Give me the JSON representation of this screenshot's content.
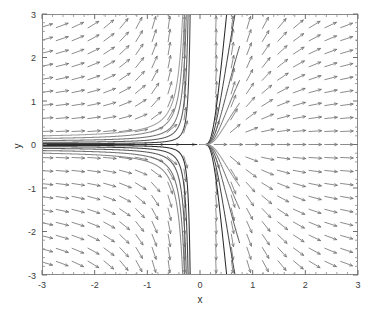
{
  "figure": {
    "background_color": "#ffffff",
    "plot_box": {
      "left": 42,
      "top": 14,
      "right": 358,
      "bottom": 275
    },
    "axis_color": "#808080",
    "tick_label_color": "#3a3a3a"
  },
  "chart_data": {
    "type": "scatter",
    "title": "",
    "subtitle": "",
    "xlabel": "x",
    "ylabel": "y",
    "xlim": [
      -3,
      3
    ],
    "ylim": [
      -3,
      3
    ],
    "xticks": [
      -3,
      -2,
      -1,
      0,
      1,
      2,
      3
    ],
    "xticklabels": [
      "-3",
      "-2",
      "-1",
      "0",
      "1",
      "2",
      "3"
    ],
    "yticks": [
      -3,
      -2,
      -1,
      0,
      1,
      2,
      3
    ],
    "yticklabels": [
      "-3",
      "-2",
      "-1",
      "0",
      "1",
      "2",
      "3"
    ],
    "minor_ticks_per_interval": 5,
    "grid": false,
    "legend": null,
    "annotations": [],
    "plot_kind": "phase-portrait-direction-field",
    "vector_field": {
      "description": "quiver field of normalized direction arrows on a uniform grid",
      "grid_nx": 21,
      "grid_ny": 21,
      "arrow_color": "#6e6e6e",
      "dx_expression": "1",
      "dy_expression": "y/(x*x)"
    },
    "trajectories": {
      "count": 11,
      "color_dark": "#2b2b2b",
      "color_light": "#b4b4b4",
      "description": "solution curves of dy/dx = y/x^2 approaching y=0 from the left and diverging steeply near x=0",
      "separatrix_y": 0,
      "initial_conditions_y_at_x_minus3": [
        0.0,
        0.02,
        0.05,
        0.09,
        0.14,
        0.2,
        -0.02,
        -0.05,
        -0.09,
        -0.14,
        -0.2
      ]
    }
  }
}
